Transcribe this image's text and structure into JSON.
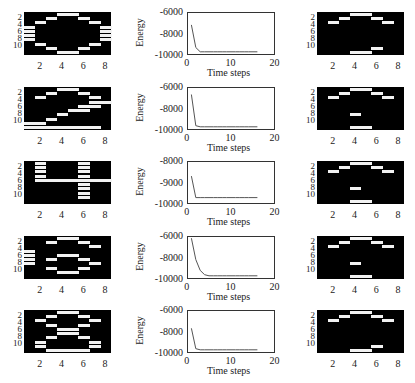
{
  "figure": {
    "rows": 5,
    "columns": [
      "input pattern",
      "energy curve",
      "recalled pattern"
    ]
  },
  "image_axes": {
    "x_ticks": [
      "2",
      "4",
      "6",
      "8"
    ],
    "y_ticks": [
      "2",
      "4",
      "6",
      "8",
      "10"
    ],
    "grid_rows": 10,
    "grid_cols": 8
  },
  "energy_axes": {
    "xlabel": "Time steps",
    "ylabel": "Energy",
    "x_ticks": [
      "0",
      "10",
      "20"
    ]
  },
  "panels": [
    {
      "input": [
        [
          1,
          4
        ],
        [
          1,
          5
        ],
        [
          2,
          3
        ],
        [
          2,
          6
        ],
        [
          3,
          2
        ],
        [
          3,
          7
        ],
        [
          4,
          1
        ],
        [
          4,
          8
        ],
        [
          5,
          1
        ],
        [
          5,
          8
        ],
        [
          6,
          1
        ],
        [
          6,
          8
        ],
        [
          7,
          1
        ],
        [
          7,
          8
        ],
        [
          8,
          2
        ],
        [
          8,
          7
        ],
        [
          9,
          3
        ],
        [
          9,
          6
        ],
        [
          10,
          4
        ],
        [
          10,
          5
        ]
      ],
      "energy_y_ticks": [
        "-6000",
        "-8000",
        "-10000"
      ],
      "recalled": [
        [
          1,
          4
        ],
        [
          1,
          5
        ],
        [
          2,
          3
        ],
        [
          2,
          6
        ],
        [
          3,
          2
        ],
        [
          3,
          7
        ],
        [
          9,
          6
        ],
        [
          10,
          4
        ],
        [
          10,
          5
        ]
      ]
    },
    {
      "input": [
        [
          1,
          4
        ],
        [
          1,
          5
        ],
        [
          2,
          3
        ],
        [
          2,
          6
        ],
        [
          3,
          2
        ],
        [
          3,
          7
        ],
        [
          4,
          7
        ],
        [
          4,
          8
        ],
        [
          5,
          6
        ],
        [
          5,
          7
        ],
        [
          6,
          5
        ],
        [
          6,
          6
        ],
        [
          7,
          4
        ],
        [
          8,
          3
        ],
        [
          9,
          1
        ],
        [
          9,
          2
        ],
        [
          10,
          1
        ],
        [
          10,
          2
        ],
        [
          10,
          3
        ],
        [
          10,
          4
        ],
        [
          10,
          5
        ],
        [
          10,
          6
        ],
        [
          10,
          7
        ]
      ],
      "energy_y_ticks": [
        "-6000",
        "-8000",
        "-10000"
      ],
      "recalled": [
        [
          1,
          4
        ],
        [
          1,
          5
        ],
        [
          2,
          3
        ],
        [
          2,
          6
        ],
        [
          3,
          2
        ],
        [
          3,
          7
        ],
        [
          7,
          4
        ],
        [
          10,
          4
        ],
        [
          10,
          5
        ]
      ]
    },
    {
      "input": [
        [
          1,
          2
        ],
        [
          2,
          2
        ],
        [
          3,
          2
        ],
        [
          4,
          2
        ],
        [
          5,
          2
        ],
        [
          5,
          3
        ],
        [
          5,
          4
        ],
        [
          5,
          5
        ],
        [
          5,
          6
        ],
        [
          5,
          7
        ],
        [
          5,
          8
        ],
        [
          1,
          6
        ],
        [
          2,
          6
        ],
        [
          3,
          6
        ],
        [
          4,
          6
        ],
        [
          6,
          6
        ],
        [
          7,
          6
        ],
        [
          8,
          6
        ],
        [
          9,
          6
        ]
      ],
      "energy_y_ticks": [
        "-8000",
        "-9000",
        "-10000"
      ],
      "recalled": [
        [
          1,
          4
        ],
        [
          1,
          5
        ],
        [
          2,
          3
        ],
        [
          2,
          6
        ],
        [
          3,
          2
        ],
        [
          3,
          7
        ],
        [
          7,
          4
        ],
        [
          10,
          4
        ],
        [
          10,
          5
        ]
      ]
    },
    {
      "input": [
        [
          1,
          4
        ],
        [
          1,
          5
        ],
        [
          2,
          3
        ],
        [
          2,
          6
        ],
        [
          3,
          7
        ],
        [
          4,
          1
        ],
        [
          5,
          1
        ],
        [
          5,
          4
        ],
        [
          5,
          5
        ],
        [
          6,
          1
        ],
        [
          6,
          3
        ],
        [
          6,
          6
        ],
        [
          7,
          1
        ],
        [
          7,
          7
        ],
        [
          8,
          3
        ],
        [
          8,
          6
        ],
        [
          9,
          4
        ],
        [
          9,
          5
        ]
      ],
      "energy_y_ticks": [
        "-6000",
        "-8000",
        "-10000"
      ],
      "recalled": [
        [
          1,
          4
        ],
        [
          1,
          5
        ],
        [
          2,
          3
        ],
        [
          2,
          6
        ],
        [
          3,
          2
        ],
        [
          3,
          7
        ],
        [
          7,
          4
        ],
        [
          10,
          4
        ],
        [
          10,
          5
        ]
      ]
    },
    {
      "input": [
        [
          1,
          4
        ],
        [
          1,
          5
        ],
        [
          2,
          3
        ],
        [
          2,
          6
        ],
        [
          3,
          2
        ],
        [
          3,
          7
        ],
        [
          4,
          3
        ],
        [
          4,
          6
        ],
        [
          5,
          4
        ],
        [
          5,
          5
        ],
        [
          6,
          4
        ],
        [
          6,
          5
        ],
        [
          7,
          3
        ],
        [
          7,
          6
        ],
        [
          8,
          2
        ],
        [
          8,
          7
        ],
        [
          9,
          2
        ],
        [
          9,
          7
        ],
        [
          10,
          3
        ],
        [
          10,
          4
        ],
        [
          10,
          5
        ],
        [
          10,
          6
        ]
      ],
      "energy_y_ticks": [
        "-6000",
        "-8000",
        "-10000"
      ],
      "recalled": [
        [
          1,
          4
        ],
        [
          1,
          5
        ],
        [
          2,
          3
        ],
        [
          2,
          6
        ],
        [
          3,
          2
        ],
        [
          3,
          7
        ],
        [
          9,
          6
        ],
        [
          10,
          4
        ],
        [
          10,
          5
        ]
      ]
    }
  ],
  "chart_data": [
    {
      "type": "heatmap",
      "title": "Input pattern 1 (digit 0)",
      "xlabel": "",
      "ylabel": "",
      "xlim": [
        0.5,
        8.5
      ],
      "ylim": [
        10.5,
        0.5
      ],
      "x_ticks": [
        2,
        4,
        6,
        8
      ],
      "y_ticks": [
        2,
        4,
        6,
        8,
        10
      ]
    },
    {
      "type": "line",
      "title": "",
      "xlabel": "Time steps",
      "ylabel": "Energy",
      "xlim": [
        0,
        20
      ],
      "ylim": [
        -10000,
        -6000
      ],
      "x": [
        1,
        2,
        3,
        4,
        5,
        6,
        7,
        8,
        9,
        10,
        11,
        12,
        13,
        14,
        15,
        16
      ],
      "values": [
        -7200,
        -9300,
        -9700,
        -9700,
        -9700,
        -9700,
        -9700,
        -9700,
        -9700,
        -9700,
        -9700,
        -9700,
        -9700,
        -9700,
        -9700,
        -9700
      ]
    },
    {
      "type": "heatmap",
      "title": "Recalled pattern 1",
      "xlim": [
        0.5,
        8.5
      ],
      "ylim": [
        10.5,
        0.5
      ]
    },
    {
      "type": "heatmap",
      "title": "Input pattern 2 (digit 2)",
      "xlim": [
        0.5,
        8.5
      ],
      "ylim": [
        10.5,
        0.5
      ]
    },
    {
      "type": "line",
      "xlabel": "Time steps",
      "ylabel": "Energy",
      "xlim": [
        0,
        20
      ],
      "ylim": [
        -10000,
        -6000
      ],
      "x": [
        1,
        2,
        3,
        4,
        5,
        6,
        7,
        8,
        9,
        10,
        11,
        12,
        13,
        14,
        15,
        16
      ],
      "values": [
        -6700,
        -9600,
        -9700,
        -9700,
        -9700,
        -9700,
        -9700,
        -9700,
        -9700,
        -9700,
        -9700,
        -9700,
        -9700,
        -9700,
        -9700,
        -9700
      ]
    },
    {
      "type": "heatmap",
      "title": "Recalled pattern 2",
      "xlim": [
        0.5,
        8.5
      ],
      "ylim": [
        10.5,
        0.5
      ]
    },
    {
      "type": "heatmap",
      "title": "Input pattern 3 (digit 4)",
      "xlim": [
        0.5,
        8.5
      ],
      "ylim": [
        10.5,
        0.5
      ]
    },
    {
      "type": "line",
      "xlabel": "Time steps",
      "ylabel": "Energy",
      "xlim": [
        0,
        20
      ],
      "ylim": [
        -10000,
        -8000
      ],
      "x": [
        1,
        2,
        3,
        4,
        5,
        6,
        7,
        8,
        9,
        10,
        11,
        12,
        13,
        14,
        15,
        16
      ],
      "values": [
        -8700,
        -9700,
        -9700,
        -9700,
        -9700,
        -9700,
        -9700,
        -9700,
        -9700,
        -9700,
        -9700,
        -9700,
        -9700,
        -9700,
        -9700,
        -9700
      ]
    },
    {
      "type": "heatmap",
      "title": "Recalled pattern 3",
      "xlim": [
        0.5,
        8.5
      ],
      "ylim": [
        10.5,
        0.5
      ]
    },
    {
      "type": "heatmap",
      "title": "Input pattern 4 (digit 6)",
      "xlim": [
        0.5,
        8.5
      ],
      "ylim": [
        10.5,
        0.5
      ]
    },
    {
      "type": "line",
      "xlabel": "Time steps",
      "ylabel": "Energy",
      "xlim": [
        0,
        20
      ],
      "ylim": [
        -10000,
        -6000
      ],
      "x": [
        1,
        2,
        3,
        4,
        5,
        6,
        7,
        8,
        9,
        10,
        11,
        12,
        13,
        14,
        15,
        16
      ],
      "values": [
        -6200,
        -8200,
        -9200,
        -9600,
        -9700,
        -9700,
        -9700,
        -9700,
        -9700,
        -9700,
        -9700,
        -9700,
        -9700,
        -9700,
        -9700,
        -9700
      ]
    },
    {
      "type": "heatmap",
      "title": "Recalled pattern 4",
      "xlim": [
        0.5,
        8.5
      ],
      "ylim": [
        10.5,
        0.5
      ]
    },
    {
      "type": "heatmap",
      "title": "Input pattern 5 (digit 8)",
      "xlim": [
        0.5,
        8.5
      ],
      "ylim": [
        10.5,
        0.5
      ]
    },
    {
      "type": "line",
      "xlabel": "Time steps",
      "ylabel": "Energy",
      "xlim": [
        0,
        20
      ],
      "ylim": [
        -10000,
        -6000
      ],
      "x": [
        1,
        2,
        3,
        4,
        5,
        6,
        7,
        8,
        9,
        10,
        11,
        12,
        13,
        14,
        15,
        16
      ],
      "values": [
        -7700,
        -9600,
        -9700,
        -9700,
        -9700,
        -9700,
        -9700,
        -9700,
        -9700,
        -9700,
        -9700,
        -9700,
        -9700,
        -9700,
        -9700,
        -9700
      ]
    },
    {
      "type": "heatmap",
      "title": "Recalled pattern 5",
      "xlim": [
        0.5,
        8.5
      ],
      "ylim": [
        10.5,
        0.5
      ]
    }
  ]
}
